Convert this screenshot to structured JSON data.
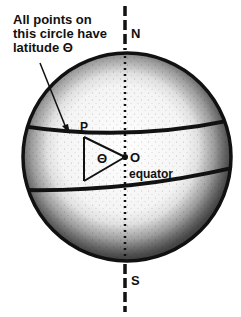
{
  "annotation": {
    "lines": [
      "All points on",
      "this circle have",
      "latitude Θ"
    ]
  },
  "labels": {
    "north": "N",
    "south": "S",
    "point_p": "P",
    "center_o": "O",
    "angle": "Θ",
    "equator": "equator"
  },
  "colors": {
    "ink": "#111111",
    "background": "#ffffff"
  }
}
